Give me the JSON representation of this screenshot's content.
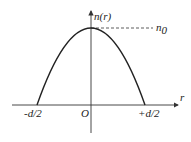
{
  "diagram": {
    "y_axis_label": "n(r)",
    "x_axis_label": "r",
    "origin_label": "O",
    "peak_label": "n",
    "peak_label_sub": "0",
    "left_label": "-d/2",
    "right_label": "+d/2"
  },
  "colors": {
    "curve": "#222222",
    "axis": "#333333",
    "background": "#ffffff"
  }
}
